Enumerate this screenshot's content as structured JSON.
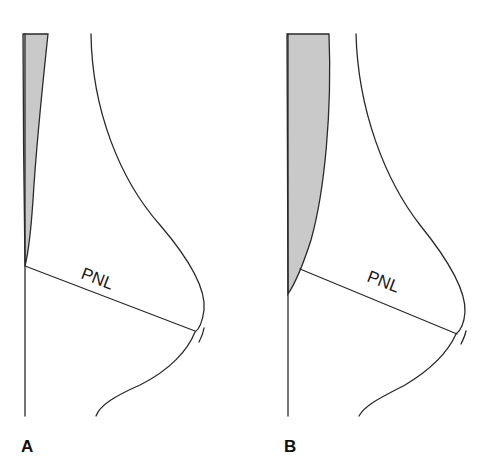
{
  "figure": {
    "panels": [
      {
        "id": "A",
        "label": "A",
        "line_label": "PNL",
        "wedge_fill": "#c9c9c9",
        "wedge_description": "thin tapered shaded region along vertical line"
      },
      {
        "id": "B",
        "label": "B",
        "line_label": "PNL",
        "wedge_fill": "#c9c9c9",
        "wedge_description": "wide shaded region along vertical line"
      }
    ],
    "stroke_color": "#2a2a2a",
    "background": "#ffffff"
  }
}
